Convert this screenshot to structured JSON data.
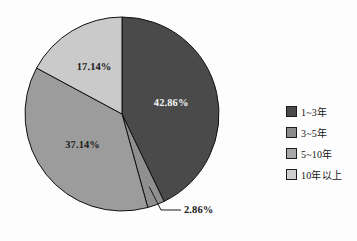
{
  "chart_data": {
    "type": "pie",
    "title": "",
    "subtitle": "",
    "xlabel": "",
    "ylabel": "",
    "legend_position": "right",
    "grid": false,
    "start_angle_deg": 0,
    "direction": "clockwise",
    "categories": [
      "1~3年",
      "3~5年",
      "5~10年",
      "10年以上"
    ],
    "values": [
      42.86,
      2.86,
      37.14,
      17.14
    ],
    "value_labels": [
      "42.86%",
      "2.86%",
      "37.14%",
      "17.14%"
    ],
    "colors": [
      "#4a4a4a",
      "#8f8f8f",
      "#9c9c9c",
      "#cacaca"
    ],
    "slices": [
      {
        "label": "1~3年",
        "value": 42.86,
        "display": "42.86%",
        "color": "#4a4a4a",
        "label_placement": "inside",
        "label_color": "light"
      },
      {
        "label": "3~5年",
        "value": 2.86,
        "display": "2.86%",
        "color": "#8f8f8f",
        "label_placement": "callout",
        "label_color": "dark"
      },
      {
        "label": "5~10年",
        "value": 37.14,
        "display": "37.14%",
        "color": "#9c9c9c",
        "label_placement": "inside",
        "label_color": "dark"
      },
      {
        "label": "10年以上",
        "value": 17.14,
        "display": "17.14%",
        "color": "#cacaca",
        "label_placement": "inside",
        "label_color": "dark"
      }
    ]
  },
  "legend": {
    "items": [
      {
        "label": "1~3年",
        "color": "#4a4a4a"
      },
      {
        "label": "3~5年",
        "color": "#8b8b8b"
      },
      {
        "label": "5~10年",
        "color": "#a8a8a8"
      },
      {
        "label": "10年以上",
        "color": "#cfcfcf"
      }
    ]
  },
  "geometry": {
    "center_x": 122,
    "center_y": 114,
    "radius": 97,
    "outline_color": "#111111"
  }
}
